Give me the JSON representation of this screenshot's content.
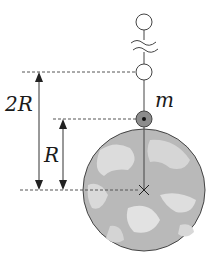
{
  "diagram": {
    "type": "physics-gravitation",
    "labels": {
      "mass": "m",
      "distance_2R": "2R",
      "distance_R": "R"
    },
    "objects": [
      {
        "id": "earth",
        "kind": "globe",
        "center": [
          144,
          190
        ],
        "radius": 61
      },
      {
        "id": "mass",
        "kind": "point-mass",
        "label": "m",
        "center": [
          144,
          119
        ]
      },
      {
        "id": "orbit-position-2R",
        "kind": "empty-circle",
        "center": [
          144,
          72
        ]
      },
      {
        "id": "far-position",
        "kind": "empty-circle",
        "center": [
          144,
          22
        ]
      }
    ],
    "dimensions": [
      {
        "label": "2R",
        "from_y": 72,
        "to_y": 190
      },
      {
        "label": "R",
        "from_y": 119,
        "to_y": 190
      }
    ],
    "colors": {
      "line": "#3a3a3a",
      "globe_fill": "#b9b9b9",
      "globe_land": "#dcdcdc",
      "mass_fill": "#8c8c8c"
    }
  }
}
